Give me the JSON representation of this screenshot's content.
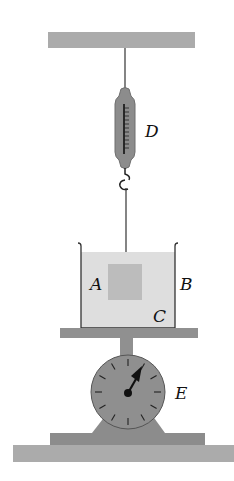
{
  "diagram": {
    "labels": {
      "A": "A",
      "B": "B",
      "C": "C",
      "D": "D",
      "E": "E"
    },
    "components": [
      {
        "id": "ceiling",
        "description": "Fixed support bar"
      },
      {
        "id": "spring-balance",
        "label": "D"
      },
      {
        "id": "block",
        "label": "A",
        "description": "Block suspended in liquid"
      },
      {
        "id": "liquid",
        "label": "C"
      },
      {
        "id": "beaker",
        "label": "B"
      },
      {
        "id": "scale",
        "label": "E",
        "description": "Dial weighing scale"
      }
    ],
    "colors": {
      "bar": "#a9a9a9",
      "liquid": "#dcdcdc",
      "block": "#b9b9b9",
      "scale": "#8f8f8f",
      "line": "#222222"
    }
  }
}
